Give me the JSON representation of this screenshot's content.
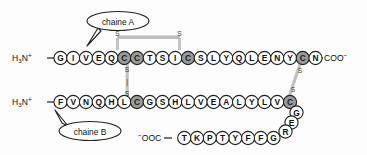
{
  "figure": {
    "background_color": "#fdfdfd",
    "residue_fill": "#ffffff",
    "cysteine_fill": "#9a9a9a",
    "outline_color": "#222222",
    "bond_color": "#b8b8b8"
  },
  "callouts": [
    {
      "id": "chain-a",
      "label": "chaine A"
    },
    {
      "id": "chain-b",
      "label": "chaine B"
    }
  ],
  "termini": {
    "chain_a_n": {
      "main": "H",
      "sub": "3",
      "rest": "N",
      "sup": "+"
    },
    "chain_a_c": {
      "text": "COO",
      "sup": "−"
    },
    "chain_b_n": {
      "main": "H",
      "sub": "3",
      "rest": "N",
      "sup": "+"
    },
    "chain_b_c": {
      "sup": "−",
      "text": "OOC"
    }
  },
  "chain_a": {
    "name": "chaine A",
    "sequence": [
      "G",
      "I",
      "V",
      "E",
      "Q",
      "C",
      "C",
      "T",
      "S",
      "I",
      "C",
      "S",
      "L",
      "Y",
      "Q",
      "L",
      "E",
      "N",
      "Y",
      "C",
      "N"
    ],
    "cysteine_positions": [
      5,
      6,
      10,
      19
    ]
  },
  "chain_b": {
    "name": "chaine B",
    "row_top": [
      "F",
      "V",
      "N",
      "Q",
      "H",
      "L",
      "C",
      "G",
      "S",
      "H",
      "L",
      "V",
      "E",
      "A",
      "L",
      "Y",
      "L",
      "V",
      "C"
    ],
    "row_top_cysteine_positions": [
      6,
      18
    ],
    "column_right": [
      "G",
      "E",
      "R"
    ],
    "row_bottom_corner": "G",
    "row_bottom": [
      "G",
      "F",
      "F",
      "Y",
      "T",
      "P",
      "K",
      "T"
    ]
  },
  "disulfide_bonds": [
    {
      "id": "intrachain-a",
      "orientation": "horizontal",
      "label_left": "S",
      "label_right": "S"
    },
    {
      "id": "interchain-left",
      "orientation": "vertical",
      "label_top": "S",
      "label_bottom": "S",
      "connector": "|"
    },
    {
      "id": "interchain-right",
      "orientation": "diagonal",
      "label_top": "S",
      "label_bottom": "S"
    }
  ]
}
